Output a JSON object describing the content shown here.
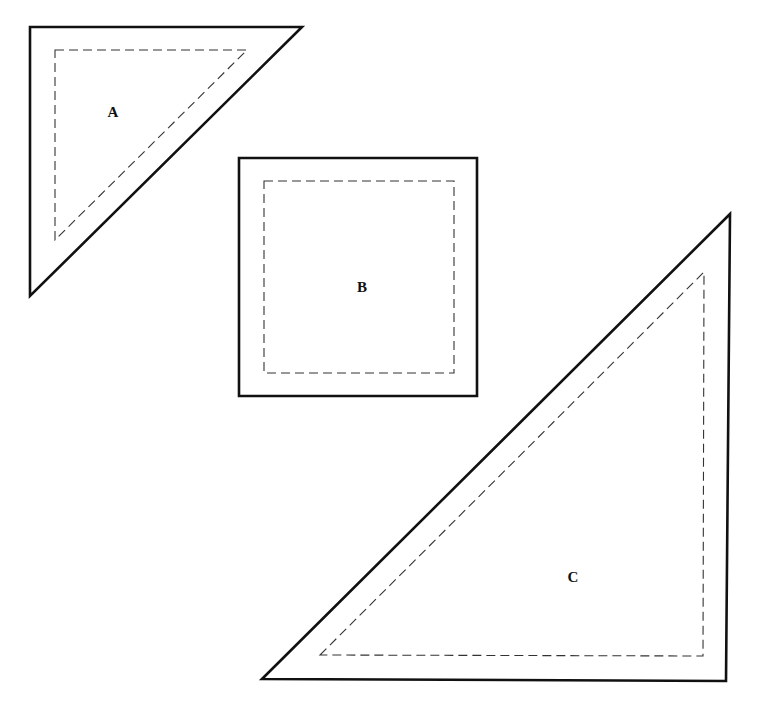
{
  "diagram": {
    "type": "quilt-pattern-templates",
    "colors": {
      "cut_line": "#111111",
      "seam_line": "#333333",
      "label": "#111111",
      "background": "#ffffff"
    },
    "pieces": [
      {
        "id": "A",
        "label": "A",
        "shape": "right-triangle",
        "outer": "30,27 302,27 30,296",
        "inner": "55,50 247,50 55,240",
        "label_pos": [
          113,
          117
        ]
      },
      {
        "id": "B",
        "label": "B",
        "shape": "square",
        "outer": "239,158 477,158 477,396 239,396",
        "inner": "264,181 454,181 454,373 264,373",
        "label_pos": [
          362,
          292
        ]
      },
      {
        "id": "C",
        "label": "C",
        "shape": "right-triangle",
        "outer": "262,679 730,214 726,681",
        "inner": "320,655 704,272 703,656",
        "label_pos": [
          573,
          582
        ]
      }
    ]
  }
}
